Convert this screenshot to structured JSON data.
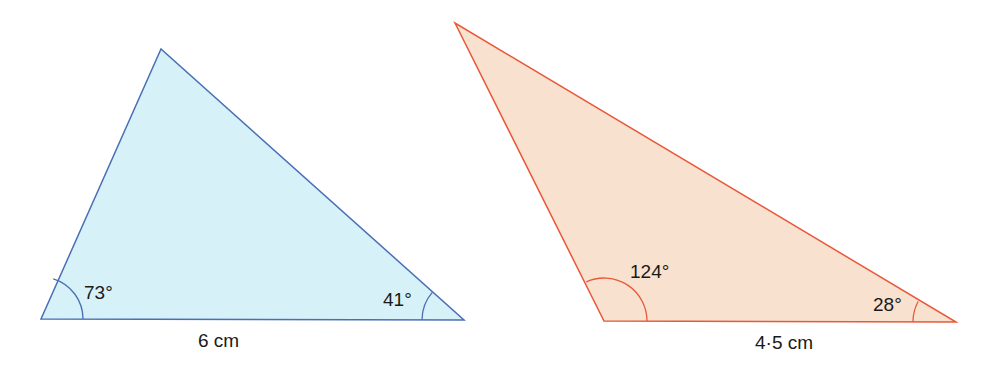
{
  "colors": {
    "blue_stroke": "#4a6fb5",
    "blue_fill": "#d6f1f8",
    "orange_stroke": "#e8583a",
    "orange_fill": "#f8e1cf",
    "text": "#1a1a1a"
  },
  "triangles": [
    {
      "id": "triangle-1",
      "angles": {
        "bottom_left": "73°",
        "bottom_right": "41°"
      },
      "base_label": "6 cm"
    },
    {
      "id": "triangle-2",
      "angles": {
        "bottom_left": "124°",
        "bottom_right": "28°"
      },
      "base_label": "4·5 cm"
    }
  ]
}
